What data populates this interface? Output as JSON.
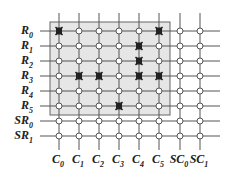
{
  "diagram": {
    "type": "crossbar-grid",
    "row_labels": [
      {
        "base": "R",
        "sub": "0"
      },
      {
        "base": "R",
        "sub": "1"
      },
      {
        "base": "R",
        "sub": "2"
      },
      {
        "base": "R",
        "sub": "3"
      },
      {
        "base": "R",
        "sub": "4"
      },
      {
        "base": "R",
        "sub": "5"
      },
      {
        "base": "SR",
        "sub": "0"
      },
      {
        "base": "SR",
        "sub": "1"
      }
    ],
    "col_labels": [
      {
        "base": "C",
        "sub": "0"
      },
      {
        "base": "C",
        "sub": "1"
      },
      {
        "base": "C",
        "sub": "2"
      },
      {
        "base": "C",
        "sub": "3"
      },
      {
        "base": "C",
        "sub": "4"
      },
      {
        "base": "C",
        "sub": "5"
      },
      {
        "base": "SC",
        "sub": "0"
      },
      {
        "base": "SC",
        "sub": "1"
      }
    ],
    "shaded_region": {
      "rows": "R0-R5",
      "cols": "C0-C5",
      "fill": "#e6e6e6"
    },
    "faulty_crosspoints": [
      {
        "row": 0,
        "col": 0
      },
      {
        "row": 0,
        "col": 5
      },
      {
        "row": 1,
        "col": 4
      },
      {
        "row": 2,
        "col": 4
      },
      {
        "row": 3,
        "col": 1
      },
      {
        "row": 3,
        "col": 2
      },
      {
        "row": 3,
        "col": 4
      },
      {
        "row": 3,
        "col": 5
      },
      {
        "row": 5,
        "col": 3
      }
    ],
    "colors": {
      "line": "#555555",
      "node_fill": "#ffffff",
      "node_stroke": "#555555",
      "fault_mark": "#222222",
      "shade": "#e6e6e6"
    }
  }
}
